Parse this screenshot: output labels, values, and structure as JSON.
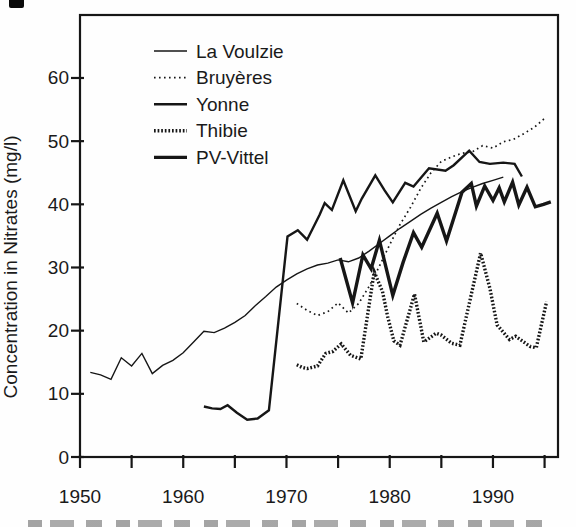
{
  "page": {
    "background": "#fefefe",
    "ink_color": "#161616",
    "has_cropped_caption_at_bottom": true,
    "has_scan_mark_top_left": true
  },
  "chart_data": {
    "type": "line",
    "title": "",
    "xlabel": "",
    "ylabel": "Concentration in Nitrates (mg/l)",
    "xlim": [
      1950,
      1996.3
    ],
    "ylim": [
      0,
      70
    ],
    "grid": false,
    "legend_position": "top-left-inside",
    "x_ticks_major": [
      1950,
      1960,
      1970,
      1980,
      1990
    ],
    "x_ticks_minor": [
      1955,
      1965,
      1975,
      1985,
      1995
    ],
    "y_ticks": [
      0,
      10,
      20,
      30,
      40,
      50,
      60
    ],
    "series": [
      {
        "name": "La Voulzie",
        "style": "solid-thin",
        "points": [
          [
            1951,
            13.4
          ],
          [
            1952,
            13.0
          ],
          [
            1953,
            12.3
          ],
          [
            1954,
            15.7
          ],
          [
            1955,
            14.4
          ],
          [
            1956,
            16.4
          ],
          [
            1957,
            13.2
          ],
          [
            1958,
            14.5
          ],
          [
            1959,
            15.3
          ],
          [
            1960,
            16.5
          ],
          [
            1961,
            18.2
          ],
          [
            1962,
            19.9
          ],
          [
            1963,
            19.7
          ],
          [
            1964,
            20.4
          ],
          [
            1965,
            21.3
          ],
          [
            1966,
            22.4
          ],
          [
            1967,
            24.0
          ],
          [
            1968,
            25.4
          ],
          [
            1969,
            26.9
          ],
          [
            1970,
            28.0
          ],
          [
            1971,
            29.0
          ],
          [
            1972,
            29.8
          ],
          [
            1973,
            30.4
          ],
          [
            1974,
            30.7
          ],
          [
            1975,
            31.2
          ],
          [
            1976,
            30.9
          ],
          [
            1977,
            31.5
          ],
          [
            1978,
            32.6
          ],
          [
            1979,
            33.8
          ],
          [
            1980,
            35.0
          ],
          [
            1981,
            36.2
          ],
          [
            1982,
            37.3
          ],
          [
            1983,
            38.4
          ],
          [
            1984,
            39.4
          ],
          [
            1985,
            40.3
          ],
          [
            1986,
            41.2
          ],
          [
            1987,
            42.0
          ],
          [
            1988,
            42.7
          ],
          [
            1989,
            43.3
          ],
          [
            1990,
            43.8
          ],
          [
            1991,
            44.3
          ]
        ]
      },
      {
        "name": "Bruyères",
        "style": "dotted",
        "points": [
          [
            1971,
            24.3
          ],
          [
            1972,
            23.2
          ],
          [
            1973,
            22.4
          ],
          [
            1974,
            23.0
          ],
          [
            1975,
            24.4
          ],
          [
            1976,
            22.8
          ],
          [
            1977,
            24.3
          ],
          [
            1978,
            27.0
          ],
          [
            1979,
            30.2
          ],
          [
            1980,
            33.6
          ],
          [
            1981,
            36.8
          ],
          [
            1982,
            39.5
          ],
          [
            1983,
            42.5
          ],
          [
            1984,
            45.0
          ],
          [
            1985,
            46.8
          ],
          [
            1986,
            47.5
          ],
          [
            1987,
            48.1
          ],
          [
            1988,
            48.3
          ],
          [
            1989,
            49.3
          ],
          [
            1990,
            48.9
          ],
          [
            1991,
            49.9
          ],
          [
            1992,
            50.3
          ],
          [
            1993,
            51.2
          ],
          [
            1994,
            52.2
          ],
          [
            1995,
            53.6
          ]
        ]
      },
      {
        "name": "Yonne",
        "style": "solid-medium",
        "points": [
          [
            1962,
            8.0
          ],
          [
            1962.8,
            7.7
          ],
          [
            1963.6,
            7.6
          ],
          [
            1964.3,
            8.2
          ],
          [
            1965.2,
            7.0
          ],
          [
            1966.2,
            5.9
          ],
          [
            1967.2,
            6.1
          ],
          [
            1968.3,
            7.4
          ],
          [
            1970.1,
            34.9
          ],
          [
            1971.1,
            35.9
          ],
          [
            1972.0,
            34.4
          ],
          [
            1973.2,
            38.3
          ],
          [
            1973.7,
            40.2
          ],
          [
            1974.4,
            39.1
          ],
          [
            1975.5,
            43.8
          ],
          [
            1976.7,
            38.9
          ],
          [
            1977.3,
            40.9
          ],
          [
            1978.6,
            44.6
          ],
          [
            1979.5,
            42.2
          ],
          [
            1980.3,
            40.3
          ],
          [
            1981.5,
            43.4
          ],
          [
            1982.3,
            42.8
          ],
          [
            1983.8,
            45.7
          ],
          [
            1985.4,
            45.3
          ],
          [
            1986.2,
            46.2
          ],
          [
            1987.7,
            48.5
          ],
          [
            1988.7,
            46.7
          ],
          [
            1989.7,
            46.4
          ],
          [
            1991.0,
            46.6
          ],
          [
            1992.1,
            46.4
          ],
          [
            1992.8,
            44.4
          ]
        ]
      },
      {
        "name": "Thibie",
        "style": "dense-dotted",
        "points": [
          [
            1971,
            14.6
          ],
          [
            1971.5,
            14.2
          ],
          [
            1972,
            14.0
          ],
          [
            1973,
            14.4
          ],
          [
            1973.8,
            16.4
          ],
          [
            1974.5,
            16.7
          ],
          [
            1975.3,
            17.9
          ],
          [
            1976.2,
            16.1
          ],
          [
            1977.2,
            15.5
          ],
          [
            1978.5,
            29.3
          ],
          [
            1979.3,
            26.2
          ],
          [
            1979.8,
            22.2
          ],
          [
            1980.4,
            18.4
          ],
          [
            1981,
            17.7
          ],
          [
            1982.4,
            25.8
          ],
          [
            1983.3,
            18.2
          ],
          [
            1984.5,
            19.6
          ],
          [
            1985,
            19.3
          ],
          [
            1986,
            18.0
          ],
          [
            1986.8,
            17.7
          ],
          [
            1988.8,
            32.3
          ],
          [
            1989.7,
            26.7
          ],
          [
            1990.4,
            20.9
          ],
          [
            1991.6,
            18.6
          ],
          [
            1992.2,
            19.1
          ],
          [
            1993.6,
            17.5
          ],
          [
            1994.2,
            17.3
          ],
          [
            1995.2,
            24.6
          ]
        ]
      },
      {
        "name": "PV-Vittel",
        "style": "solid-thick",
        "points": [
          [
            1975.2,
            31.5
          ],
          [
            1976.4,
            24.4
          ],
          [
            1977.4,
            32.0
          ],
          [
            1978.2,
            29.8
          ],
          [
            1979.0,
            34.3
          ],
          [
            1980.3,
            25.6
          ],
          [
            1981.3,
            30.8
          ],
          [
            1982.3,
            35.5
          ],
          [
            1983.1,
            33.2
          ],
          [
            1984.6,
            38.6
          ],
          [
            1985.5,
            34.2
          ],
          [
            1987.0,
            41.9
          ],
          [
            1987.9,
            43.3
          ],
          [
            1988.4,
            39.7
          ],
          [
            1989.2,
            42.9
          ],
          [
            1990.0,
            40.6
          ],
          [
            1990.6,
            42.6
          ],
          [
            1991.1,
            40.4
          ],
          [
            1991.9,
            43.5
          ],
          [
            1992.5,
            39.9
          ],
          [
            1993.3,
            42.7
          ],
          [
            1994.1,
            39.6
          ],
          [
            1994.9,
            40.0
          ],
          [
            1995.6,
            40.4
          ]
        ]
      }
    ]
  }
}
